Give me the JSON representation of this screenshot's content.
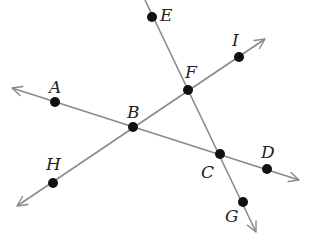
{
  "diagram": {
    "type": "geometry-lines-and-points",
    "colors": {
      "line": "#8a8a8a",
      "point": "#111111",
      "label": "#222222"
    },
    "points": [
      {
        "name": "A",
        "label": "A",
        "x": 55,
        "y": 102,
        "lx": 49,
        "ly": 93
      },
      {
        "name": "B",
        "label": "B",
        "x": 133,
        "y": 127,
        "lx": 127,
        "ly": 118
      },
      {
        "name": "C",
        "label": "C",
        "x": 220,
        "y": 154,
        "lx": 201,
        "ly": 178
      },
      {
        "name": "D",
        "label": "D",
        "x": 267,
        "y": 169,
        "lx": 261,
        "ly": 158
      },
      {
        "name": "E",
        "label": "E",
        "x": 152,
        "y": 17,
        "lx": 160,
        "ly": 21
      },
      {
        "name": "F",
        "label": "F",
        "x": 188,
        "y": 90,
        "lx": 185,
        "ly": 78
      },
      {
        "name": "G",
        "label": "G",
        "x": 243,
        "y": 202,
        "lx": 225,
        "ly": 222
      },
      {
        "name": "H",
        "label": "H",
        "x": 53,
        "y": 183,
        "lx": 46,
        "ly": 170
      },
      {
        "name": "I",
        "label": "I",
        "x": 239,
        "y": 57,
        "lx": 232,
        "ly": 46
      }
    ],
    "lines": [
      {
        "name": "line-AD",
        "through": [
          "A",
          "B",
          "C",
          "D"
        ],
        "x1": 12,
        "y1": 88,
        "x2": 299,
        "y2": 180
      },
      {
        "name": "line-HI",
        "through": [
          "H",
          "B",
          "F",
          "I"
        ],
        "x1": 17,
        "y1": 206,
        "x2": 265,
        "y2": 39
      },
      {
        "name": "line-EG",
        "through": [
          "E",
          "F",
          "C",
          "G"
        ],
        "x1": 145,
        "y1": 0,
        "x2": 256,
        "y2": 232
      }
    ]
  }
}
